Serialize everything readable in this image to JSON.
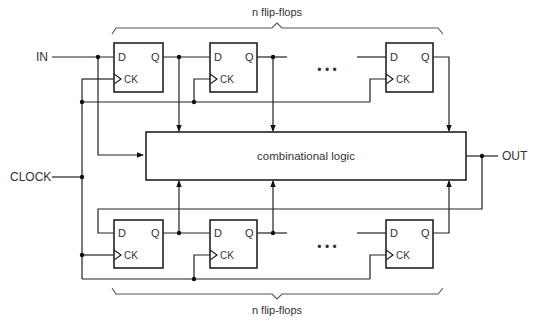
{
  "diagram": {
    "inputs": {
      "in_label": "IN",
      "clock_label": "CLOCK"
    },
    "output": {
      "out_label": "OUT"
    },
    "logic_block": {
      "label": "combinational logic"
    },
    "top_bank": {
      "brace_label": "n flip-flops",
      "flip_flops": [
        {
          "d": "D",
          "q": "Q",
          "ck": "CK"
        },
        {
          "d": "D",
          "q": "Q",
          "ck": "CK"
        },
        {
          "d": "D",
          "q": "Q",
          "ck": "CK"
        }
      ],
      "ellipsis": "• • •"
    },
    "bottom_bank": {
      "brace_label": "n flip-flops",
      "flip_flops": [
        {
          "d": "D",
          "q": "Q",
          "ck": "CK"
        },
        {
          "d": "D",
          "q": "Q",
          "ck": "CK"
        },
        {
          "d": "D",
          "q": "Q",
          "ck": "CK"
        }
      ],
      "ellipsis": "• • •"
    }
  }
}
